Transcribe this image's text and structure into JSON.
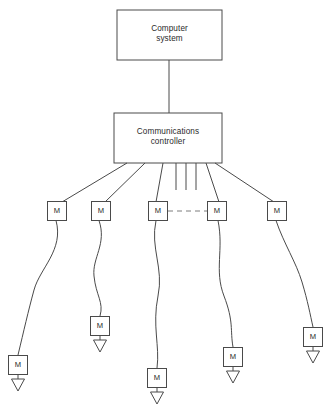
{
  "diagram": {
    "stroke_color": "#4a4a4a",
    "background": "#ffffff",
    "nodes": {
      "computer": {
        "label": "Computer\nsystem",
        "x": 117,
        "y": 10,
        "w": 105,
        "h": 50
      },
      "controller": {
        "label": "Communications\ncontroller",
        "x": 114,
        "y": 113,
        "w": 108,
        "h": 50
      }
    },
    "trunk_line": {
      "x": 169,
      "y1": 60,
      "y2": 113
    },
    "controller_stubs": [
      {
        "x": 176,
        "y1": 163,
        "y2": 190
      },
      {
        "x": 186,
        "y1": 163,
        "y2": 190
      },
      {
        "x": 196,
        "y1": 163,
        "y2": 190
      }
    ],
    "modem_label": "M",
    "top_modems": [
      {
        "name": "modem-top-1",
        "label": "M",
        "cx": 57,
        "cy": 211
      },
      {
        "name": "modem-top-2",
        "label": "M",
        "cx": 101,
        "cy": 211
      },
      {
        "name": "modem-top-3",
        "label": "M",
        "cx": 158,
        "cy": 211
      },
      {
        "name": "modem-top-4",
        "label": "M",
        "cx": 217,
        "cy": 211
      },
      {
        "name": "modem-top-5",
        "label": "M",
        "cx": 277,
        "cy": 211
      }
    ],
    "bottom_modems": [
      {
        "name": "modem-bottom-1",
        "label": "M",
        "cx": 18,
        "cy": 365
      },
      {
        "name": "modem-bottom-2",
        "label": "M",
        "cx": 100,
        "cy": 326
      },
      {
        "name": "modem-bottom-3",
        "label": "M",
        "cx": 157,
        "cy": 378
      },
      {
        "name": "modem-bottom-4",
        "label": "M",
        "cx": 233,
        "cy": 357
      },
      {
        "name": "modem-bottom-5",
        "label": "M",
        "cx": 313,
        "cy": 337
      }
    ],
    "terminals": [
      {
        "name": "terminal-1",
        "cx": 18,
        "cy": 385
      },
      {
        "name": "terminal-2",
        "cx": 100,
        "cy": 346
      },
      {
        "name": "terminal-3",
        "cx": 157,
        "cy": 398
      },
      {
        "name": "terminal-4",
        "cx": 233,
        "cy": 377
      },
      {
        "name": "terminal-5",
        "cx": 313,
        "cy": 357
      }
    ],
    "dashed_link": {
      "x1": 168,
      "x2": 207,
      "y": 211
    },
    "modem_box_size": 19,
    "terminal_size": 13
  }
}
